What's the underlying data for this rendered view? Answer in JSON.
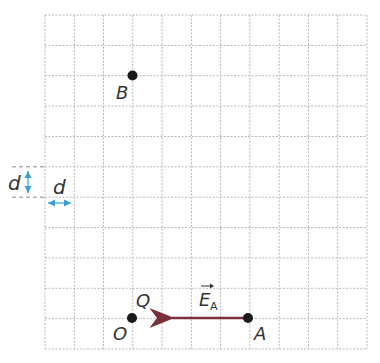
{
  "grid": {
    "cols": 11,
    "rows": 11,
    "left": 45,
    "top": 15,
    "right": 367,
    "bottom": 349,
    "line_color": "#b8b8b8"
  },
  "points": {
    "B": {
      "label": "B",
      "x": 132,
      "y": 75
    },
    "O": {
      "label": "O",
      "x": 132,
      "y": 318
    },
    "Q": {
      "label": "Q"
    },
    "A": {
      "label": "A",
      "x": 248,
      "y": 318
    }
  },
  "vector": {
    "label": "E",
    "subscript": "A",
    "from": "A",
    "direction": "toward O",
    "color": "#7a2e38"
  },
  "scale": {
    "vertical_label": "d",
    "horizontal_label": "d",
    "color": "#3aa0d8"
  }
}
